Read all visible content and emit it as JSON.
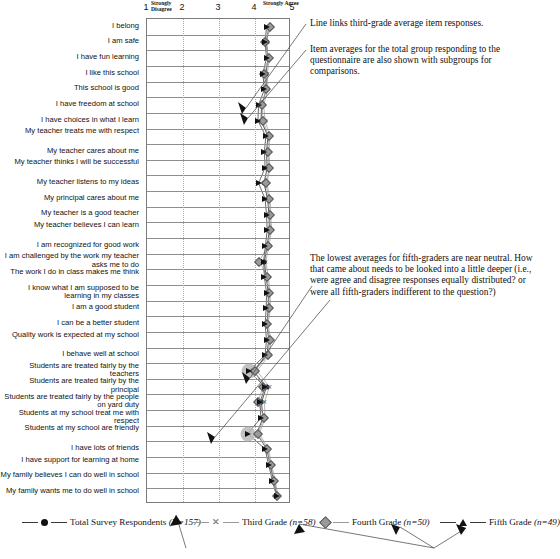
{
  "chart_data": {
    "type": "scatter",
    "title": "",
    "xlabel": "",
    "ylabel": "",
    "xlim": [
      1,
      5
    ],
    "grid": true,
    "legend_position": "bottom",
    "axis": {
      "ticks": [
        {
          "value": 1,
          "num": "1",
          "word": "Strongly Disagree"
        },
        {
          "value": 2,
          "num": "2",
          "word": ""
        },
        {
          "value": 3,
          "num": "3",
          "word": ""
        },
        {
          "value": 4,
          "num": "4",
          "word": ""
        },
        {
          "value": 5,
          "num": "5",
          "word": "Strongly Agree"
        }
      ]
    },
    "categories": [
      "I belong",
      "I am safe",
      "I have fun learning",
      "I like this school",
      "This school is good",
      "I have freedom at school",
      "I have choices in what I learn",
      "My teacher treats me with respect",
      "My teacher cares about me",
      "My teacher thinks I will be successful",
      "My teacher listens to my ideas",
      "My principal cares about me",
      "My teacher is a good teacher",
      "My teacher believes I can learn",
      "I am recognized for good work",
      "I am challenged by the work my teacher asks me to do",
      "The work I do in class makes me think",
      "I know what I am supposed to be learning in my classes",
      "I am a good student",
      "I can be a better student",
      "Quality work is expected at my school",
      "I behave well at school",
      "Students are treated fairly by the teachers",
      "Students are treated fairly by the principal",
      "Students are treated fairly by the people on yard duty",
      "Students at my school treat me with respect",
      "Students at my school are friendly",
      "I have lots of friends",
      "I have support for learning at home",
      "My family believes I can do well in school",
      "My family wants me to do well in school"
    ],
    "series": [
      {
        "name": "Total Survey Respondents",
        "n_label": "(N=157)",
        "marker": "circle",
        "color": "#111111",
        "values": [
          4.38,
          4.32,
          4.36,
          4.3,
          4.32,
          4.18,
          4.17,
          4.36,
          4.32,
          4.34,
          4.25,
          4.35,
          4.39,
          4.4,
          4.34,
          4.26,
          4.31,
          4.37,
          4.37,
          4.33,
          4.38,
          4.33,
          3.95,
          4.32,
          4.18,
          4.22,
          4.05,
          4.33,
          4.42,
          4.52,
          4.62
        ]
      },
      {
        "name": "Third Grade",
        "n_label": "(n=58)",
        "marker": "x",
        "color": "#8a8a8a",
        "values": [
          4.46,
          4.25,
          4.4,
          4.34,
          4.36,
          4.24,
          4.28,
          4.42,
          4.38,
          4.42,
          4.33,
          4.42,
          4.44,
          4.46,
          4.39,
          4.3,
          4.37,
          4.42,
          4.43,
          4.36,
          4.44,
          4.4,
          4.05,
          4.4,
          4.26,
          4.28,
          4.12,
          4.38,
          4.46,
          4.56,
          4.64
        ]
      },
      {
        "name": "Fourth Grade",
        "n_label": "(n=50)",
        "marker": "diamond",
        "color": "#9a9a9a",
        "values": [
          4.41,
          4.29,
          4.38,
          4.26,
          4.3,
          4.2,
          4.22,
          4.38,
          4.35,
          4.4,
          4.3,
          4.38,
          4.41,
          4.43,
          4.35,
          4.12,
          4.34,
          4.39,
          4.4,
          4.34,
          4.41,
          4.36,
          3.99,
          4.22,
          4.08,
          4.26,
          4.07,
          4.34,
          4.44,
          4.54,
          4.62
        ]
      },
      {
        "name": "Fifth Grade",
        "n_label": "(n=49)",
        "marker": "triangle",
        "color": "#111111",
        "values": [
          4.32,
          4.28,
          4.32,
          4.22,
          4.26,
          4.1,
          4.08,
          4.3,
          4.26,
          4.28,
          4.1,
          4.28,
          4.32,
          4.34,
          4.29,
          4.24,
          4.26,
          4.32,
          4.31,
          4.28,
          4.32,
          4.28,
          3.82,
          4.28,
          4.14,
          4.16,
          3.8,
          4.28,
          4.38,
          4.48,
          4.6
        ]
      }
    ],
    "highlights": [
      {
        "category_index": 22,
        "note": "lowest average highlighted"
      },
      {
        "category_index": 26,
        "note": "lowest average highlighted"
      }
    ],
    "annotations": [
      {
        "id": "anno-line-links",
        "text": "Line links third-grade average item responses."
      },
      {
        "id": "anno-item-averages",
        "text": "Item averages for the total group responding to the questionnaire are also shown with subgroups for comparisons."
      },
      {
        "id": "anno-lowest-averages",
        "text": "The lowest averages for fifth-graders are near neutral. How that came about needs to be looked into a little deeper (i.e., were agree and disagree responses equally distributed? or were all fifth-graders indifferent to the question?)"
      }
    ]
  }
}
